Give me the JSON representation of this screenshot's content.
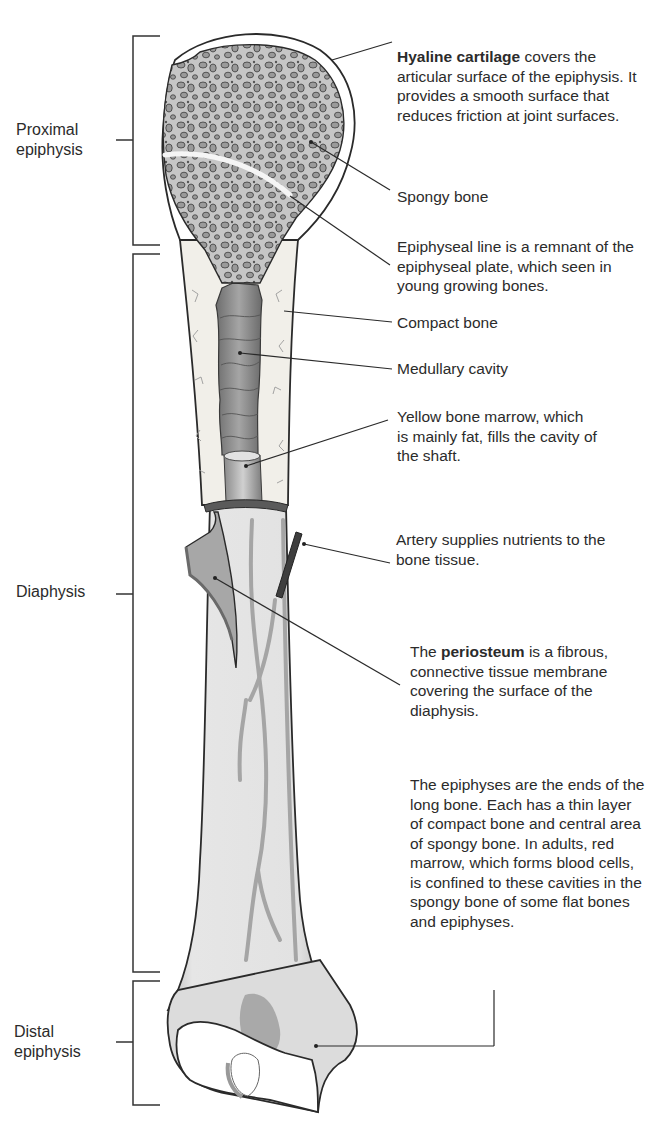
{
  "diagram": {
    "type": "anatomy-long-bone",
    "regions": [
      {
        "id": "proximal",
        "label_line1": "Proximal",
        "label_line2": "epiphysis"
      },
      {
        "id": "diaphysis",
        "label_line1": "Diaphysis"
      },
      {
        "id": "distal",
        "label_line1": "Distal",
        "label_line2": "epiphysis"
      }
    ],
    "callouts": {
      "hyaline": {
        "bold": "Hyaline cartilage",
        "rest": " covers the articular surface of the epiphysis. It provides a smooth surface that reduces friction at joint surfaces."
      },
      "spongy": {
        "text": "Spongy bone"
      },
      "epiphyseal_line": {
        "text": "Epiphyseal line is a remnant of the epiphyseal plate, which seen in young growing bones."
      },
      "compact": {
        "text": "Compact bone"
      },
      "medullary": {
        "text": "Medullary cavity"
      },
      "yellow_marrow": {
        "text": "Yellow bone marrow, which is mainly fat, fills the cavity of the shaft."
      },
      "artery": {
        "text": "Artery supplies nutrients to the bone tissue."
      },
      "periosteum": {
        "pre": "The ",
        "bold": "periosteum",
        "rest": " is a fibrous, connective tissue membrane covering the surface of the diaphysis."
      },
      "epiphyses": {
        "text": "The epiphyses are the ends of the long bone. Each has a thin layer of compact bone and central area of spongy bone. In adults, red marrow, which forms blood cells, is confined to these cavities in the spongy bone of some flat bones and epiphyses."
      }
    },
    "colors": {
      "outline": "#2a2a2a",
      "bone_fill": "#e4e4e4",
      "spongy_fill": "#c8c8c8",
      "hole_fill": "#9a9a9a",
      "cavity": "#8c8c8c",
      "vessel": "#a8a8a8",
      "artery": "#4a4a4a",
      "cartilage": "#ffffff"
    }
  }
}
